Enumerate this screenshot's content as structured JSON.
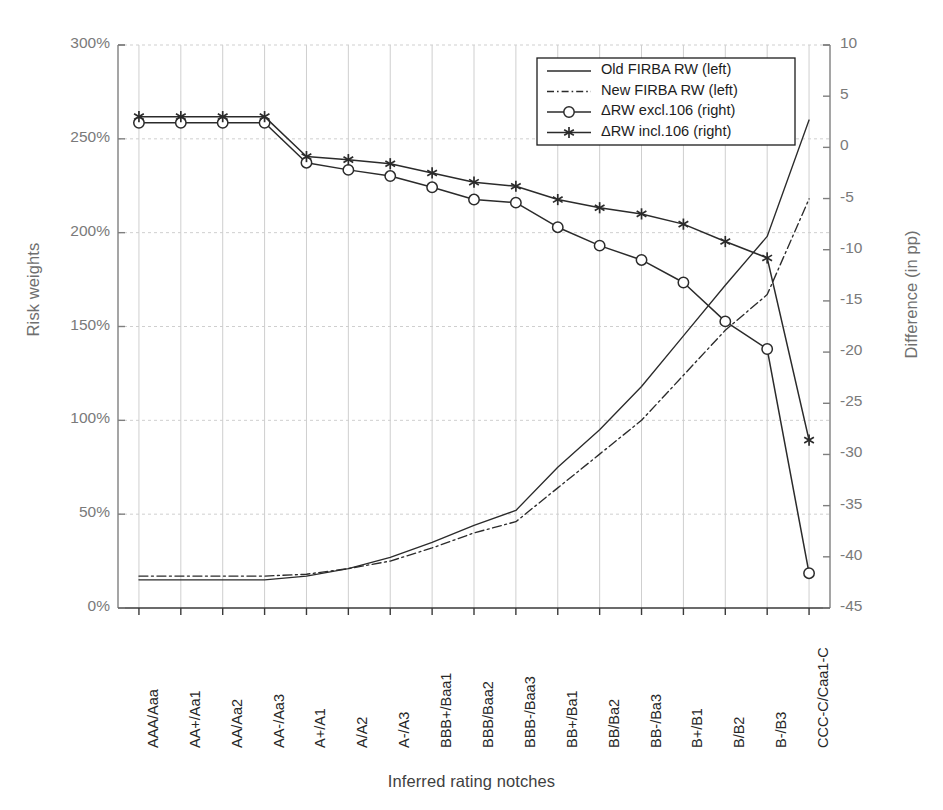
{
  "chart_data": {
    "type": "line",
    "title": "",
    "xlabel": "Inferred rating notches",
    "ylabel": "Risk weights",
    "ylabel_right": "Difference (in pp)",
    "ylim": [
      0,
      300
    ],
    "ylim_right": [
      -45,
      10
    ],
    "ytick_labels": [
      "0%",
      "50%",
      "100%",
      "150%",
      "200%",
      "250%",
      "300%"
    ],
    "ytick_values": [
      0,
      50,
      100,
      150,
      200,
      250,
      300
    ],
    "ytick_right_labels": [
      "-45",
      "-40",
      "-35",
      "-30",
      "-25",
      "-20",
      "-15",
      "-10",
      "-5",
      "0",
      "5",
      "10"
    ],
    "ytick_right_values": [
      -45,
      -40,
      -35,
      -30,
      -25,
      -20,
      -15,
      -10,
      -5,
      0,
      5,
      10
    ],
    "grid": true,
    "legend_position": "top-right",
    "categories": [
      "AAA/Aaa",
      "AA+/Aa1",
      "AA/Aa2",
      "AA-/Aa3",
      "A+/A1",
      "A/A2",
      "A-/A3",
      "BBB+/Baa1",
      "BBB/Baa2",
      "BBB-/Baa3",
      "BB+/Ba1",
      "BB/Ba2",
      "BB-/Ba3",
      "B+/B1",
      "B/B2",
      "B-/B3",
      "CCC-C/Caa1-C"
    ],
    "series": [
      {
        "name": "Old FIRBA RW (left)",
        "axis": "left",
        "unit": "%",
        "style": "solid",
        "marker": "none",
        "values": [
          15,
          15,
          15,
          15,
          17,
          21,
          27,
          35,
          44,
          52,
          75,
          95,
          118,
          145,
          172,
          198,
          260
        ]
      },
      {
        "name": "New FIRBA RW (left)",
        "axis": "left",
        "unit": "%",
        "style": "dash-dot",
        "marker": "none",
        "values": [
          17,
          17,
          17,
          17,
          18,
          21,
          25,
          32,
          40,
          46,
          64,
          82,
          100,
          124,
          148,
          167,
          218
        ]
      },
      {
        "name": "ΔRW excl.106 (right)",
        "axis": "right",
        "unit": "pp",
        "style": "solid",
        "marker": "circle",
        "values": [
          2.4,
          2.4,
          2.4,
          2.4,
          -1.5,
          -2.2,
          -2.8,
          -3.9,
          -5.1,
          -5.4,
          -7.8,
          -9.6,
          -11.0,
          -13.2,
          -17.0,
          -19.7,
          -41.6
        ]
      },
      {
        "name": "ΔRW incl.106 (right)",
        "axis": "right",
        "unit": "pp",
        "style": "solid",
        "marker": "asterisk",
        "values": [
          3.0,
          3.0,
          3.0,
          3.0,
          -0.9,
          -1.2,
          -1.6,
          -2.5,
          -3.4,
          -3.8,
          -5.1,
          -5.9,
          -6.5,
          -7.5,
          -9.2,
          -10.8,
          -28.6
        ]
      }
    ]
  },
  "legend": {
    "items": [
      {
        "label": "Old FIRBA RW (left)",
        "style": "solid",
        "marker": "none"
      },
      {
        "label": "New FIRBA RW (left)",
        "style": "dash-dot",
        "marker": "none"
      },
      {
        "label": "ΔRW excl.106 (right)",
        "style": "solid",
        "marker": "circle"
      },
      {
        "label": "ΔRW incl.106 (right)",
        "style": "solid",
        "marker": "asterisk"
      }
    ]
  },
  "colors": {
    "line": "#2b2b2b",
    "grid": "#cfcfcf",
    "axis": "#7f7f7f",
    "tick_text": "#7a7a7a",
    "xtick_text": "#272727",
    "background": "#ffffff"
  }
}
